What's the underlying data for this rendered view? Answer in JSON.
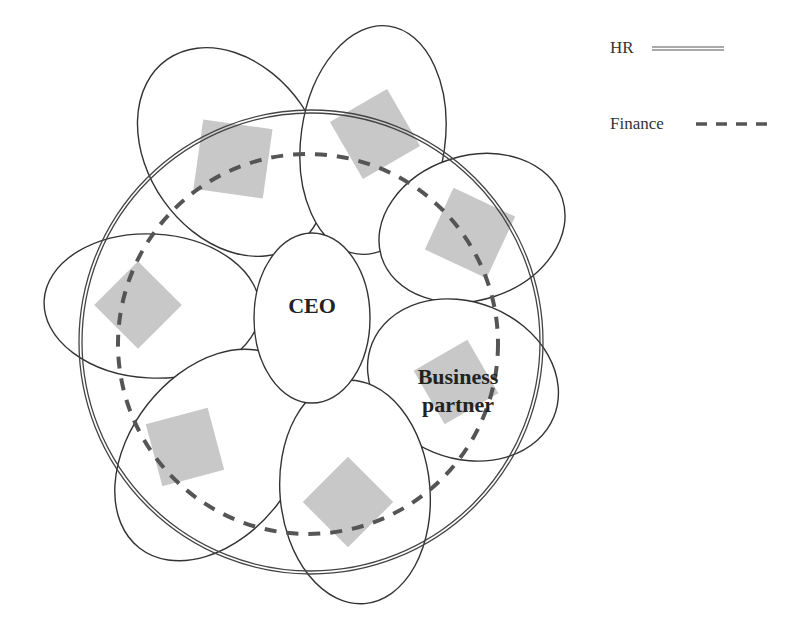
{
  "legend": {
    "items": [
      {
        "label": "HR",
        "line_style": "double-solid"
      },
      {
        "label": "Finance",
        "line_style": "dashed"
      }
    ]
  },
  "diagram": {
    "center_node": {
      "label": "CEO"
    },
    "highlight_node": {
      "label_line1": "Business",
      "label_line2": "partner"
    },
    "petal_count": 7,
    "colors": {
      "stroke": "#333333",
      "square_fill": "#c8c8c8",
      "dash": "#555555"
    }
  }
}
